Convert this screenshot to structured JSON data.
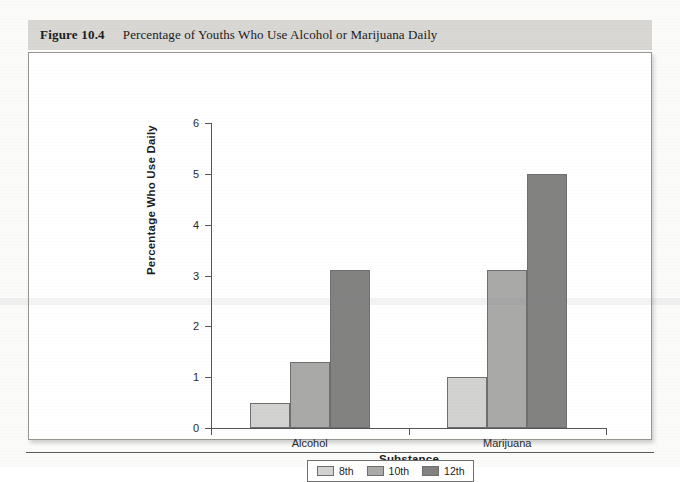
{
  "figure": {
    "number": "Figure 10.4",
    "caption": "Percentage of Youths Who Use Alcohol or Marijuana Daily"
  },
  "legend": {
    "items": [
      {
        "label": "8th",
        "color": "#d2d2d0"
      },
      {
        "label": "10th",
        "color": "#a9a9a7"
      },
      {
        "label": "12th",
        "color": "#828281"
      }
    ]
  },
  "chart_data": {
    "type": "bar",
    "title": "Percentage of Youths Who Use Alcohol or Marijuana Daily",
    "xlabel": "Substance",
    "ylabel": "Percentage Who Use Daily",
    "categories": [
      "Alcohol",
      "Marijuana"
    ],
    "series": [
      {
        "name": "8th",
        "values": [
          0.5,
          1.0
        ],
        "color": "#d2d2d0"
      },
      {
        "name": "10th",
        "values": [
          1.3,
          3.1
        ],
        "color": "#a9a9a7"
      },
      {
        "name": "12th",
        "values": [
          3.1,
          5.0
        ],
        "color": "#828281"
      }
    ],
    "ylim": [
      0,
      6
    ],
    "yticks": [
      0,
      1,
      2,
      3,
      4,
      5,
      6
    ],
    "ytick_labels": [
      "0",
      "1",
      "2",
      "3",
      "4",
      "5",
      "6"
    ],
    "grid": false,
    "legend_position": "bottom"
  }
}
